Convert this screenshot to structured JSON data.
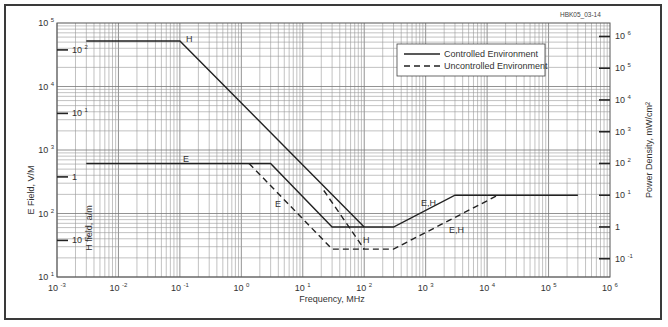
{
  "figure": {
    "id_label": "HBK05_03-14"
  },
  "chart_data": {
    "type": "line",
    "title": "",
    "xlabel": "Frequency, MHz",
    "ylabel": "E Field, V/M",
    "ylabel_inner": "H field, a/m",
    "ylabel_right": "Power Density, mW/cm²",
    "xscale": "log",
    "yscale": "log",
    "xlim": [
      0.001,
      1000000
    ],
    "ylim": [
      10,
      100000
    ],
    "grid": true,
    "legend_position": "upper right",
    "x_ticks": [
      {
        "base": "10",
        "exp": "-3",
        "value": 0.001
      },
      {
        "base": "10",
        "exp": "-2",
        "value": 0.01
      },
      {
        "base": "10",
        "exp": "-1",
        "value": 0.1
      },
      {
        "base": "10",
        "exp": "0",
        "value": 1
      },
      {
        "base": "10",
        "exp": "1",
        "value": 10
      },
      {
        "base": "10",
        "exp": "2",
        "value": 100
      },
      {
        "base": "10",
        "exp": "3",
        "value": 1000
      },
      {
        "base": "10",
        "exp": "4",
        "value": 10000
      },
      {
        "base": "10",
        "exp": "5",
        "value": 100000
      },
      {
        "base": "10",
        "exp": "6",
        "value": 1000000
      }
    ],
    "y_ticks_left": [
      {
        "base": "10",
        "exp": "5",
        "value": 100000
      },
      {
        "base": "10",
        "exp": "4",
        "value": 10000
      },
      {
        "base": "10",
        "exp": "3",
        "value": 1000
      },
      {
        "base": "10",
        "exp": "2",
        "value": 100
      },
      {
        "base": "10",
        "exp": "1",
        "value": 10
      }
    ],
    "h_field_ticks": [
      {
        "base": "10",
        "exp": "2",
        "value": 100,
        "e_equiv": 37700
      },
      {
        "base": "10",
        "exp": "1",
        "value": 10,
        "e_equiv": 3770
      },
      {
        "base": "1",
        "exp": "",
        "value": 1,
        "e_equiv": 377
      },
      {
        "base": "10",
        "exp": "-1",
        "value": 0.1,
        "e_equiv": 37.7
      }
    ],
    "power_density_ticks": [
      {
        "base": "10",
        "exp": "6",
        "value": 1000000,
        "e_equiv": 61400
      },
      {
        "base": "10",
        "exp": "5",
        "value": 100000,
        "e_equiv": 19400
      },
      {
        "base": "10",
        "exp": "4",
        "value": 10000,
        "e_equiv": 6140
      },
      {
        "base": "10",
        "exp": "3",
        "value": 1000,
        "e_equiv": 1940
      },
      {
        "base": "10",
        "exp": "2",
        "value": 100,
        "e_equiv": 614
      },
      {
        "base": "10",
        "exp": "1",
        "value": 10,
        "e_equiv": 194
      },
      {
        "base": "1",
        "exp": "",
        "value": 1,
        "e_equiv": 61.4
      },
      {
        "base": "10",
        "exp": "-1",
        "value": 0.1,
        "e_equiv": 19.4
      }
    ],
    "legend": [
      {
        "label": "Controlled Environment",
        "style": "solid"
      },
      {
        "label": "Uncontrolled Environment",
        "style": "dashed"
      }
    ],
    "series": [
      {
        "name": "Controlled H",
        "style": "solid",
        "label": "H",
        "points": [
          [
            0.003,
            52000
          ],
          [
            0.1,
            52000
          ],
          [
            100,
            61.4
          ]
        ]
      },
      {
        "name": "Controlled E",
        "style": "solid",
        "label": "E",
        "points": [
          [
            0.003,
            614
          ],
          [
            3,
            614
          ],
          [
            30,
            61.4
          ],
          [
            300,
            61.4
          ],
          [
            3000,
            194
          ],
          [
            300000,
            194
          ]
        ]
      },
      {
        "name": "Uncontrolled E",
        "style": "dashed",
        "label": "E",
        "points": [
          [
            1.34,
            614
          ],
          [
            30,
            27.5
          ],
          [
            300,
            27.5
          ],
          [
            15000,
            194
          ]
        ]
      },
      {
        "name": "Uncontrolled H",
        "style": "dashed",
        "label": "H",
        "points": [
          [
            22,
            230
          ],
          [
            100,
            27.5
          ]
        ]
      }
    ],
    "annotations": [
      {
        "text": "H",
        "near": "controlled H break at 0.1 MHz"
      },
      {
        "text": "E",
        "near": "controlled E flat segment"
      },
      {
        "text": "E",
        "near": "uncontrolled E slope"
      },
      {
        "text": "H",
        "near": "uncontrolled H slope"
      },
      {
        "text": "E,H",
        "near": "controlled rising segment"
      },
      {
        "text": "E,H",
        "near": "uncontrolled rising segment"
      }
    ]
  }
}
